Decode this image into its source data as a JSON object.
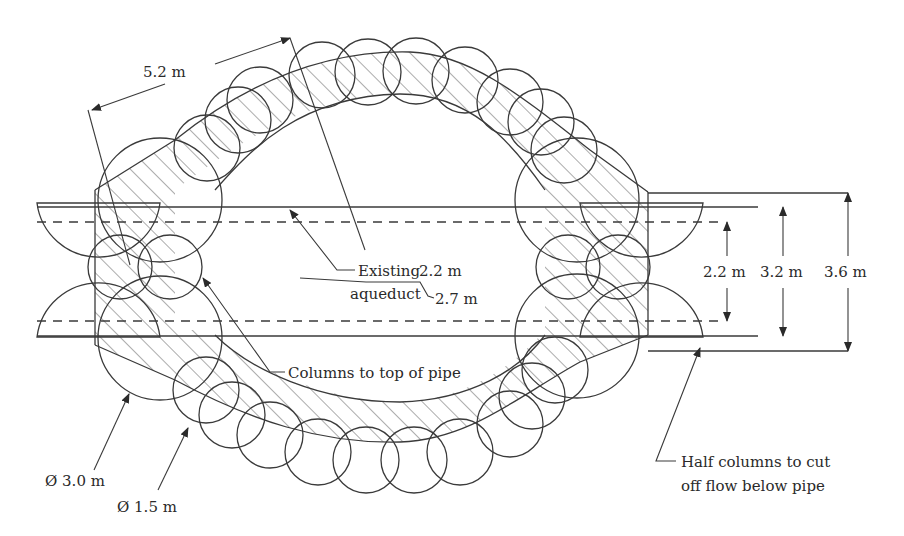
{
  "diagram": {
    "type": "engineering-plan",
    "colors": {
      "line": "#3a3a3a",
      "background": "#ffffff",
      "text": "#2a2a2a"
    },
    "labels": {
      "ring_width": "5.2 m",
      "existing_aqueduct_line1": "Existing",
      "existing_aqueduct_line2": "aqueduct",
      "pipe_inner": "2.2 m",
      "pipe_outer": "2.7 m",
      "columns_to_top": "Columns to top of pipe",
      "dim_2_2": "2.2 m",
      "dim_3_2": "3.2 m",
      "dim_3_6": "3.6 m",
      "large_col_dia": "Ø 3.0 m",
      "small_col_dia": "Ø 1.5 m",
      "half_columns_line1": "Half columns to cut",
      "half_columns_line2": "off flow below pipe"
    },
    "dimensions": [
      {
        "label": "2.2 m",
        "meaning": "pipe inner diameter"
      },
      {
        "label": "3.2 m",
        "meaning": "pipe outer extent"
      },
      {
        "label": "3.6 m",
        "meaning": "overall cut-off width"
      },
      {
        "label": "5.2 m",
        "meaning": "ring thickness"
      },
      {
        "label": "Ø 3.0 m",
        "meaning": "large column diameter"
      },
      {
        "label": "Ø 1.5 m",
        "meaning": "small column diameter"
      }
    ]
  }
}
